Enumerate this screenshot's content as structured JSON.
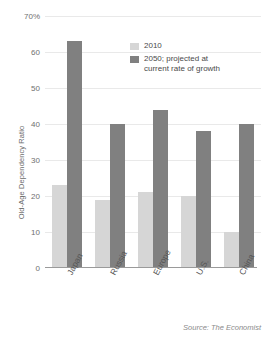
{
  "chart_data": {
    "type": "bar",
    "title": "",
    "xlabel": "",
    "ylabel": "Old-Age Dependency Ratio",
    "categories": [
      "Japan",
      "Russia",
      "Europe",
      "U.S.",
      "China"
    ],
    "series": [
      {
        "name": "2010",
        "color": "#d6d6d6",
        "values": [
          23,
          19,
          21,
          20,
          10
        ]
      },
      {
        "name": "2050; projected at\ncurrent rate of growth",
        "color": "#808080",
        "values": [
          63,
          40,
          44,
          38,
          40
        ]
      }
    ],
    "ylim": [
      0,
      70
    ],
    "yticks": [
      {
        "value": 70,
        "label": "70%"
      },
      {
        "value": 60,
        "label": "60"
      },
      {
        "value": 50,
        "label": "50"
      },
      {
        "value": 40,
        "label": "40"
      },
      {
        "value": 30,
        "label": "30"
      },
      {
        "value": 20,
        "label": "20"
      },
      {
        "value": 10,
        "label": "10"
      },
      {
        "value": 0,
        "label": "0"
      }
    ],
    "grid": true,
    "legend_position": "top-right",
    "source": "Source: The Economist"
  }
}
